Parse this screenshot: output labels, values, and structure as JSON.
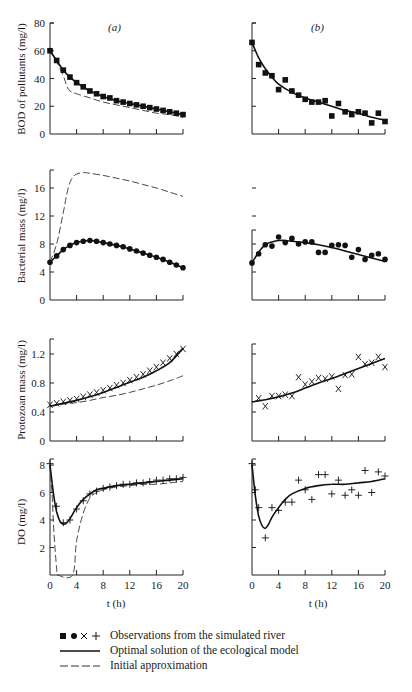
{
  "figure": {
    "panel_labels": [
      "(a)",
      "(b)"
    ],
    "xlabel": "t (h)",
    "xticks": [
      "0",
      "4",
      "8",
      "12",
      "16",
      "20"
    ]
  },
  "legend": {
    "observations_symbols": "■ ● X +",
    "observations": "Observations from the simulated river",
    "optimal": "Optimal solution of the ecological model",
    "initial": "Initial approximation"
  },
  "chart_data": [
    {
      "type": "line",
      "title": "BOD of pollutants (a)",
      "panel": "a",
      "xlabel": "t (h)",
      "ylabel": "BOD of pollutants (mg/l)",
      "yticks": [
        0,
        20,
        40,
        60,
        80
      ],
      "ylim": [
        0,
        80
      ],
      "xlim": [
        0,
        20
      ],
      "marker": "square",
      "observations": {
        "x": [
          0,
          1,
          2,
          3,
          4,
          5,
          6,
          7,
          8,
          9,
          10,
          11,
          12,
          13,
          14,
          15,
          16,
          17,
          18,
          19,
          20
        ],
        "y": [
          60,
          53,
          46,
          41,
          37,
          34,
          31,
          29,
          27,
          26,
          24,
          23,
          22,
          21,
          20,
          19,
          18,
          17,
          16,
          15,
          14
        ]
      },
      "optimal": {
        "x": [
          0,
          1,
          2,
          3,
          4,
          5,
          6,
          8,
          10,
          12,
          14,
          16,
          18,
          20
        ],
        "y": [
          60,
          53,
          46,
          41,
          37,
          34,
          31,
          27,
          24,
          22,
          20,
          18,
          16,
          14
        ]
      },
      "initial": {
        "x": [
          0,
          1,
          2,
          2.5,
          3,
          4,
          6,
          8,
          10,
          12,
          14,
          16,
          18,
          20
        ],
        "y": [
          60,
          52,
          42,
          35,
          31,
          29,
          26,
          23,
          21,
          19,
          17,
          15,
          14,
          12
        ]
      }
    },
    {
      "type": "scatter",
      "title": "BOD of pollutants (b)",
      "panel": "b",
      "ylim": [
        0,
        80
      ],
      "xlim": [
        0,
        20
      ],
      "marker": "square",
      "observations": {
        "x": [
          0,
          1,
          2,
          3,
          4,
          5,
          6,
          7,
          8,
          9,
          10,
          11,
          12,
          13,
          14,
          15,
          16,
          17,
          18,
          19,
          20
        ],
        "y": [
          66,
          50,
          44,
          42,
          32,
          39,
          31,
          28,
          25,
          23,
          23,
          24,
          13,
          22,
          16,
          14,
          16,
          15,
          8,
          15,
          9
        ]
      },
      "optimal": {
        "x": [
          0,
          1,
          2,
          3,
          4,
          6,
          8,
          10,
          12,
          14,
          16,
          18,
          20
        ],
        "y": [
          66,
          55,
          47,
          41,
          36,
          30,
          26,
          23,
          20,
          17,
          15,
          12,
          10
        ]
      }
    },
    {
      "type": "line",
      "title": "Bacterial mass (a)",
      "panel": "a",
      "ylabel": "Bacterial mass (mg/l)",
      "yticks": [
        0,
        4,
        8,
        12,
        16
      ],
      "ylim": [
        0,
        18.5
      ],
      "xlim": [
        0,
        20
      ],
      "marker": "dot",
      "observations": {
        "x": [
          0,
          1,
          2,
          3,
          4,
          5,
          6,
          7,
          8,
          9,
          10,
          11,
          12,
          13,
          14,
          15,
          16,
          17,
          18,
          19,
          20
        ],
        "y": [
          5.4,
          6.3,
          7.2,
          7.8,
          8.2,
          8.4,
          8.5,
          8.4,
          8.2,
          8.0,
          7.8,
          7.6,
          7.3,
          7.0,
          6.7,
          6.4,
          6.1,
          5.8,
          5.4,
          5.0,
          4.6
        ]
      },
      "optimal": {
        "x": [
          0,
          1,
          2,
          3,
          4,
          5,
          6,
          7,
          8,
          10,
          12,
          14,
          16,
          18,
          20
        ],
        "y": [
          5.4,
          6.3,
          7.2,
          7.8,
          8.2,
          8.4,
          8.5,
          8.4,
          8.2,
          7.8,
          7.3,
          6.7,
          6.1,
          5.4,
          4.6
        ]
      },
      "initial": {
        "x": [
          0,
          1,
          2,
          2.5,
          3,
          3.5,
          4,
          5,
          6,
          8,
          10,
          12,
          14,
          16,
          18,
          20
        ],
        "y": [
          5.4,
          8,
          12.5,
          15,
          16.8,
          17.6,
          18,
          18.2,
          18.1,
          17.8,
          17.4,
          17,
          16.5,
          16,
          15.4,
          14.8
        ]
      }
    },
    {
      "type": "scatter",
      "title": "Bacterial mass (b)",
      "panel": "b",
      "ylim": [
        0,
        18.5
      ],
      "xlim": [
        0,
        20
      ],
      "marker": "dot",
      "observations": {
        "x": [
          0,
          1,
          2,
          3,
          4,
          5,
          6,
          7,
          8,
          9,
          10,
          11,
          12,
          13,
          14,
          15,
          16,
          17,
          18,
          19,
          20
        ],
        "y": [
          5.3,
          6.6,
          7.9,
          7.7,
          9.0,
          8.2,
          8.8,
          8.0,
          8.3,
          8.3,
          6.8,
          6.8,
          7.8,
          7.9,
          7.8,
          6.1,
          7.2,
          5.8,
          6.4,
          6.6,
          5.8
        ]
      },
      "optimal": {
        "x": [
          0,
          1,
          2,
          3,
          4,
          5,
          6,
          8,
          10,
          12,
          14,
          16,
          18,
          20
        ],
        "y": [
          5.3,
          6.8,
          7.9,
          8.3,
          8.5,
          8.5,
          8.4,
          8.2,
          7.9,
          7.5,
          7.0,
          6.5,
          6.0,
          5.5
        ]
      }
    },
    {
      "type": "line",
      "title": "Protozoan mass (a)",
      "panel": "a",
      "ylabel": "Protozoan mass (mg/l)",
      "yticks": [
        0,
        0.4,
        0.8,
        1.2
      ],
      "ylim": [
        0,
        1.4
      ],
      "xlim": [
        0,
        20
      ],
      "marker": "x",
      "observations": {
        "x": [
          0,
          1,
          2,
          3,
          4,
          5,
          6,
          7,
          8,
          9,
          10,
          11,
          12,
          13,
          14,
          15,
          16,
          17,
          18,
          19,
          20
        ],
        "y": [
          0.5,
          0.52,
          0.54,
          0.56,
          0.58,
          0.61,
          0.64,
          0.67,
          0.7,
          0.73,
          0.77,
          0.8,
          0.84,
          0.88,
          0.92,
          0.97,
          1.02,
          1.08,
          1.14,
          1.2,
          1.27
        ]
      },
      "optimal": {
        "x": [
          0,
          2,
          4,
          6,
          8,
          10,
          12,
          14,
          16,
          18,
          20
        ],
        "y": [
          0.48,
          0.52,
          0.56,
          0.61,
          0.67,
          0.74,
          0.81,
          0.88,
          0.97,
          1.08,
          1.28
        ]
      },
      "initial": {
        "x": [
          0,
          2,
          4,
          6,
          8,
          10,
          12,
          14,
          16,
          18,
          20
        ],
        "y": [
          0.48,
          0.51,
          0.53,
          0.56,
          0.6,
          0.63,
          0.67,
          0.72,
          0.77,
          0.83,
          0.9
        ]
      }
    },
    {
      "type": "scatter",
      "title": "Protozoan mass (b)",
      "panel": "b",
      "ylim": [
        0,
        1.4
      ],
      "xlim": [
        0,
        20
      ],
      "marker": "x",
      "observations": {
        "x": [
          1,
          2,
          3,
          4,
          5,
          6,
          7,
          8,
          9,
          10,
          11,
          12,
          13,
          14,
          15,
          16,
          17,
          18,
          19,
          20
        ],
        "y": [
          0.59,
          0.48,
          0.62,
          0.62,
          0.64,
          0.62,
          0.88,
          0.78,
          0.82,
          0.87,
          0.86,
          0.89,
          0.72,
          0.91,
          0.92,
          1.16,
          1.06,
          1.08,
          1.16,
          1.02
        ]
      },
      "optimal": {
        "x": [
          0,
          2,
          4,
          6,
          8,
          10,
          12,
          14,
          16,
          18,
          20
        ],
        "y": [
          0.54,
          0.57,
          0.61,
          0.66,
          0.73,
          0.8,
          0.86,
          0.93,
          1.0,
          1.07,
          1.14
        ]
      }
    },
    {
      "type": "line",
      "title": "DO (a)",
      "panel": "a",
      "ylabel": "DO (mg/l)",
      "yticks": [
        2,
        4,
        6,
        8
      ],
      "ylim": [
        0,
        8.4
      ],
      "xlim": [
        0,
        20
      ],
      "marker": "plus",
      "observations": {
        "x": [
          0,
          1,
          2,
          3,
          4,
          5,
          6,
          7,
          8,
          9,
          10,
          11,
          12,
          13,
          14,
          15,
          16,
          17,
          18,
          19,
          20
        ],
        "y": [
          8.1,
          5.0,
          3.8,
          4.0,
          4.8,
          5.4,
          5.9,
          6.1,
          6.3,
          6.4,
          6.5,
          6.6,
          6.6,
          6.7,
          6.7,
          6.8,
          6.9,
          6.9,
          7.0,
          7.0,
          7.1
        ]
      },
      "optimal": {
        "x": [
          0,
          0.5,
          1,
          1.5,
          2,
          2.5,
          3,
          4,
          5,
          6,
          7,
          8,
          10,
          12,
          14,
          16,
          18,
          20
        ],
        "y": [
          8.0,
          6.0,
          4.6,
          3.9,
          3.7,
          3.8,
          4.1,
          4.9,
          5.5,
          5.9,
          6.2,
          6.3,
          6.5,
          6.6,
          6.7,
          6.8,
          6.9,
          7.0
        ]
      },
      "initial": {
        "x": [
          0,
          0.3,
          0.6,
          1,
          1.2,
          3.4,
          4,
          5,
          6,
          7,
          8,
          10,
          12,
          14,
          16,
          18,
          20
        ],
        "y": [
          8.0,
          6.0,
          3.0,
          0.5,
          0,
          0,
          2.5,
          4.5,
          5.6,
          6.0,
          6.2,
          6.4,
          6.5,
          6.6,
          6.6,
          6.7,
          6.8
        ]
      }
    },
    {
      "type": "scatter",
      "title": "DO (b)",
      "panel": "b",
      "ylim": [
        0,
        8.4
      ],
      "xlim": [
        0,
        20
      ],
      "marker": "plus",
      "observations": {
        "x": [
          0,
          0.5,
          1,
          2,
          3,
          4,
          5,
          6,
          7,
          8,
          9,
          10,
          11,
          12,
          13,
          14,
          15,
          16,
          17,
          18,
          19,
          20
        ],
        "y": [
          8.1,
          6.2,
          4.9,
          2.7,
          4.9,
          4.7,
          5.3,
          5.3,
          6.9,
          6.2,
          5.5,
          7.3,
          7.3,
          5.9,
          6.9,
          5.8,
          6.2,
          5.8,
          7.6,
          6.0,
          7.5,
          7.2
        ]
      },
      "optimal": {
        "x": [
          0,
          0.5,
          1,
          1.5,
          2,
          2.5,
          3,
          4,
          5,
          6,
          8,
          10,
          12,
          14,
          16,
          18,
          20
        ],
        "y": [
          8.0,
          5.8,
          4.3,
          3.6,
          3.4,
          3.7,
          4.2,
          4.9,
          5.5,
          5.9,
          6.3,
          6.5,
          6.6,
          6.6,
          6.7,
          6.8,
          7.0
        ]
      }
    }
  ]
}
